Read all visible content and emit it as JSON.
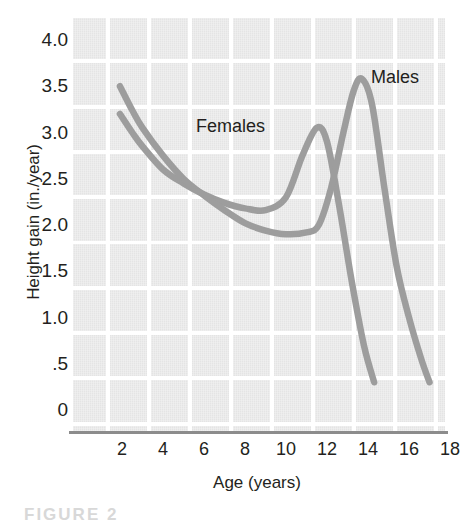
{
  "chart_data": {
    "type": "line",
    "title": "",
    "xlabel": "Age (years)",
    "ylabel": "Height gain (in./year)",
    "xlim": [
      1,
      18
    ],
    "ylim": [
      0,
      4.2
    ],
    "xticks": [
      2,
      4,
      6,
      8,
      10,
      12,
      14,
      16,
      18
    ],
    "xtick_labels": [
      "2",
      "4",
      "6",
      "8",
      "10",
      "12",
      "14",
      "16",
      "18"
    ],
    "yticks": [
      0,
      0.5,
      1.0,
      1.5,
      2.0,
      2.5,
      3.0,
      3.5,
      4.0
    ],
    "ytick_labels": [
      "0",
      ".5",
      "1.0",
      "1.5",
      "2.0",
      "2.5",
      "3.0",
      "3.5",
      "4.0"
    ],
    "grid": true,
    "legend": "inline annotations",
    "annotations": [
      {
        "text": "Females",
        "x": 8.2,
        "y": 3.1
      },
      {
        "text": "Males",
        "x": 16.0,
        "y": 3.55
      }
    ],
    "series": [
      {
        "name": "Females",
        "color": "#9d9d9d",
        "x": [
          1.9,
          2.5,
          3.0,
          4.0,
          5.0,
          6.0,
          7.0,
          8.0,
          9.0,
          10.0,
          10.8,
          11.5,
          12.0,
          12.6,
          13.2,
          13.8,
          14.3
        ],
        "values": [
          3.2,
          3.0,
          2.85,
          2.6,
          2.45,
          2.33,
          2.24,
          2.18,
          2.16,
          2.3,
          2.75,
          3.05,
          2.9,
          2.2,
          1.4,
          0.7,
          0.3
        ]
      },
      {
        "name": "Males",
        "color": "#9d9d9d",
        "x": [
          1.9,
          2.5,
          3.0,
          4.0,
          5.0,
          6.0,
          7.0,
          8.0,
          9.0,
          10.0,
          11.0,
          11.6,
          12.2,
          12.8,
          13.3,
          13.7,
          14.2,
          14.8,
          15.4,
          16.0,
          16.6,
          17.0
        ],
        "values": [
          3.5,
          3.24,
          3.05,
          2.75,
          2.5,
          2.32,
          2.16,
          2.02,
          1.94,
          1.9,
          1.92,
          2.0,
          2.4,
          3.0,
          3.45,
          3.58,
          3.3,
          2.4,
          1.55,
          1.0,
          0.55,
          0.3
        ]
      }
    ]
  },
  "axes": {
    "y_title": "Height gain (in./year)",
    "x_title": "Age (years)"
  },
  "caption": {
    "text": "FIGURE 2"
  }
}
